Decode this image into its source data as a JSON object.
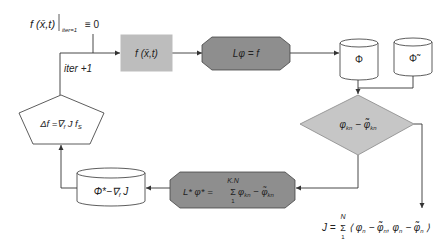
{
  "colors": {
    "rect_fill": "#bdbdbd",
    "octagon_fill": "#8e8e8e",
    "diamond_fill": "#c6c6c6",
    "cylinder_fill": "#ffffff",
    "stroke": "#333333"
  },
  "init_label": {
    "main": "f (x̄,t)",
    "subscript": "iter=1",
    "rhs": "≡ 0"
  },
  "loop_label": "iter +1",
  "nodes": {
    "source_rect": "f (x̄,t)",
    "solver_octagon": "Lφ = f",
    "cylinder_phi": "Φ",
    "cylinder_phi_tilde": "Φ̃",
    "diamond": {
      "main": "φ",
      "sub": "kn",
      "minus": " − ",
      "main2": "φ̃",
      "sub2": "kn"
    },
    "adjoint_octagon": {
      "lhs": "L* φ* = ",
      "sum_top": "K.N",
      "sum": "Σ",
      "sum_bottom": "1",
      "term": "φ",
      "term_sub": "kn",
      "minus": " − ",
      "term2": "φ̃",
      "term2_sub": "kn"
    },
    "cylinder_gradient": "Φ*−∇",
    "cylinder_gradient_sub": "f",
    "cylinder_gradient_tail": " J",
    "pentagon": {
      "a": "Δf =∇",
      "sub": "f",
      "b": " J f",
      "sub2": "S"
    }
  },
  "objective": {
    "lhs": "J = ",
    "sum": "Σ",
    "sum_top": "N",
    "sum_bottom": "1",
    "body": "⟨ φ",
    "s1": "n",
    "m1": " − φ̃",
    "s2": "n",
    "c": ", φ",
    "s3": "n",
    "m2": " − φ̃",
    "s4": "n",
    "end": " ⟩"
  }
}
